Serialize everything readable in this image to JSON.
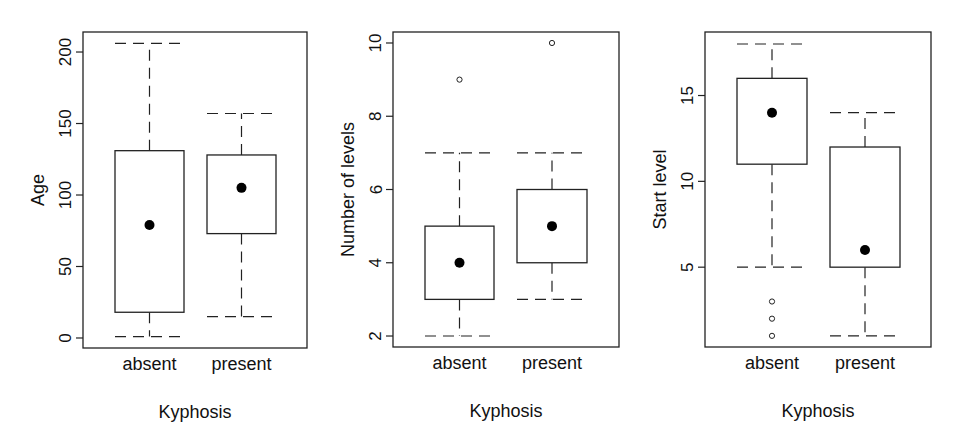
{
  "chart_data": [
    {
      "type": "box",
      "title": "",
      "xlabel": "Kyphosis",
      "ylabel": "Age",
      "categories": [
        "absent",
        "present"
      ],
      "yticks": [
        0,
        50,
        100,
        150,
        200
      ],
      "ylim": [
        -7,
        214
      ],
      "series": [
        {
          "name": "absent",
          "whisker_low": 1,
          "q1": 18,
          "median": 79,
          "q3": 131,
          "whisker_high": 206,
          "outliers": []
        },
        {
          "name": "present",
          "whisker_low": 15,
          "q1": 73,
          "median": 105,
          "q3": 128,
          "whisker_high": 157,
          "outliers": []
        }
      ]
    },
    {
      "type": "box",
      "title": "",
      "xlabel": "Kyphosis",
      "ylabel": "Number of levels",
      "categories": [
        "absent",
        "present"
      ],
      "yticks": [
        2,
        4,
        6,
        8,
        10
      ],
      "ylim": [
        1.7,
        10.3
      ],
      "series": [
        {
          "name": "absent",
          "whisker_low": 2,
          "q1": 3,
          "median": 4,
          "q3": 5,
          "whisker_high": 7,
          "outliers": [
            9
          ]
        },
        {
          "name": "present",
          "whisker_low": 3,
          "q1": 4,
          "median": 5,
          "q3": 6,
          "whisker_high": 7,
          "outliers": [
            10
          ]
        }
      ]
    },
    {
      "type": "box",
      "title": "",
      "xlabel": "Kyphosis",
      "ylabel": "Start level",
      "categories": [
        "absent",
        "present"
      ],
      "yticks": [
        5,
        10,
        15
      ],
      "ylim": [
        0.35,
        18.7
      ],
      "series": [
        {
          "name": "absent",
          "whisker_low": 5,
          "q1": 11,
          "median": 14,
          "q3": 16,
          "whisker_high": 18,
          "outliers": [
            1,
            2,
            3
          ]
        },
        {
          "name": "present",
          "whisker_low": 1,
          "q1": 5,
          "median": 6,
          "q3": 12,
          "whisker_high": 14,
          "outliers": []
        }
      ]
    }
  ],
  "layout": {
    "panels": [
      {
        "frame": [
          83,
          32,
          307,
          348
        ],
        "box_x": [
          [
            115,
            184
          ],
          [
            207,
            276
          ]
        ],
        "ylabel_x": 38,
        "ticklabel_x": 66
      },
      {
        "frame": [
          393,
          32,
          619,
          347
        ],
        "box_x": [
          [
            425,
            494
          ],
          [
            517,
            587
          ]
        ],
        "ylabel_x": 348,
        "ticklabel_x": 376
      },
      {
        "frame": [
          705,
          32,
          931,
          347
        ],
        "box_x": [
          [
            737,
            807
          ],
          [
            830,
            900
          ]
        ],
        "ylabel_x": 660,
        "ticklabel_x": 688
      }
    ],
    "colors": {
      "line": "#222222",
      "background": "#ffffff",
      "point": "#000000"
    }
  }
}
